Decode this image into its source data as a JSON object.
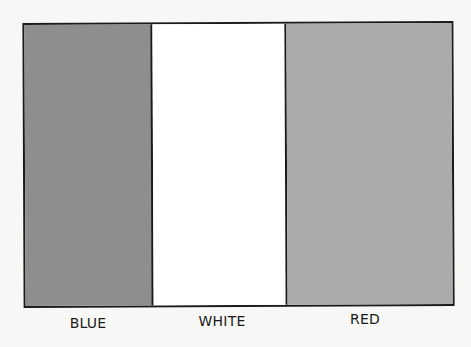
{
  "diagram": {
    "type": "tricolor-flag",
    "stripes": [
      {
        "label": "BLUE",
        "fill": "#8e8e8e"
      },
      {
        "label": "WHITE",
        "fill": "#ffffff"
      },
      {
        "label": "RED",
        "fill": "#ababab"
      }
    ]
  }
}
